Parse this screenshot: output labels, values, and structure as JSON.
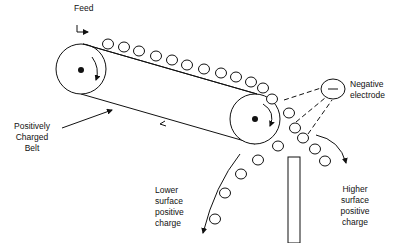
{
  "diagram": {
    "type": "electrostatic-belt-separator",
    "labels": {
      "feed": "Feed",
      "negative_electrode": "Negative\nelectrode",
      "positively_charged_belt": "Positively\nCharged\nBelt",
      "lower_charge": "Lower\nsurface\npositive\ncharge",
      "higher_charge": "Higher\nsurface\npositive\ncharge"
    },
    "electrode_symbol": "–",
    "colors": {
      "stroke": "#111111",
      "background": "#ffffff"
    },
    "components": {
      "left_roller": {
        "cx": 81,
        "cy": 69,
        "r": 25
      },
      "right_roller": {
        "cx": 255,
        "cy": 119,
        "r": 25
      },
      "electrode": {
        "cx": 333,
        "cy": 89,
        "rx": 12,
        "ry": 10
      },
      "splitter": {
        "x": 288,
        "y": 157,
        "width": 12,
        "height": 86
      }
    }
  }
}
